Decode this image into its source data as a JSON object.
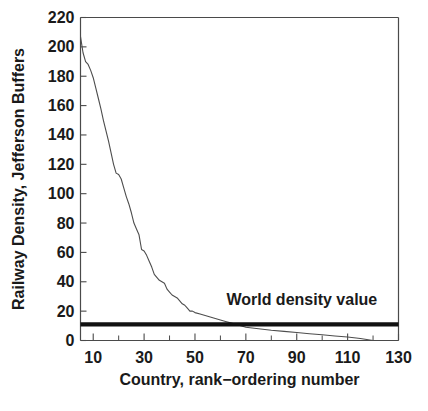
{
  "chart_data": {
    "type": "line",
    "title": "",
    "subtitle": "",
    "xlabel": "Country, rank−ordering number",
    "ylabel": "Railway Density, Jefferson Buffers",
    "xlim": [
      5,
      130
    ],
    "ylim": [
      0,
      220
    ],
    "grid": false,
    "legend_position": "none",
    "x_ticks_major": [
      10,
      30,
      50,
      70,
      90,
      110,
      130
    ],
    "x_ticks_major_labels": [
      "10",
      "30",
      "50",
      "70",
      "90",
      "110",
      "130"
    ],
    "x_ticks_minor": [
      20,
      40,
      60,
      80,
      100,
      120
    ],
    "y_ticks_major": [
      0,
      20,
      40,
      60,
      80,
      100,
      120,
      140,
      160,
      180,
      200,
      220
    ],
    "y_ticks_major_labels": [
      "0",
      "20",
      "40",
      "60",
      "80",
      "100",
      "120",
      "140",
      "160",
      "180",
      "200",
      "220"
    ],
    "series": [
      {
        "name": "Railway density by country rank",
        "style": "thin-line",
        "color": "#4d4d4d",
        "x": [
          5,
          6,
          7,
          8,
          9,
          10,
          11,
          12,
          13,
          14,
          15,
          16,
          17,
          18,
          19,
          20,
          21,
          22,
          23,
          24,
          25,
          26,
          27,
          28,
          29,
          30,
          31,
          32,
          33,
          34,
          35,
          36,
          37,
          38,
          39,
          40,
          41,
          42,
          43,
          44,
          45,
          46,
          47,
          48,
          49,
          50,
          52,
          54,
          56,
          58,
          60,
          62,
          64,
          66,
          68,
          70,
          75,
          80,
          85,
          90,
          95,
          100,
          105,
          110,
          115,
          120
        ],
        "y": [
          207,
          196,
          190,
          188,
          184,
          179,
          172,
          165,
          158,
          150,
          143,
          136,
          128,
          120,
          114,
          113,
          110,
          104,
          98,
          93,
          87,
          80,
          76,
          72,
          62,
          61,
          58,
          54,
          50,
          45,
          43,
          41,
          40,
          39,
          35,
          33,
          31,
          30,
          29,
          27,
          25,
          24,
          22,
          20,
          20,
          19,
          18,
          17,
          16,
          15,
          14,
          13,
          12,
          11,
          10,
          9,
          8,
          7,
          6.2,
          5.4,
          4.6,
          3.9,
          3.1,
          2.4,
          1.4,
          0
        ]
      },
      {
        "name": "World density value",
        "style": "thick-horizontal-reference",
        "color": "#111111",
        "value": 11,
        "x_span": [
          5,
          130
        ]
      }
    ],
    "annotations": [
      {
        "text": "World density value",
        "x": 92,
        "y": 24
      }
    ]
  },
  "figure": {
    "background_color": "#ffffff",
    "axis_color": "#4a4a4a",
    "text_color": "#1a1a1a"
  }
}
